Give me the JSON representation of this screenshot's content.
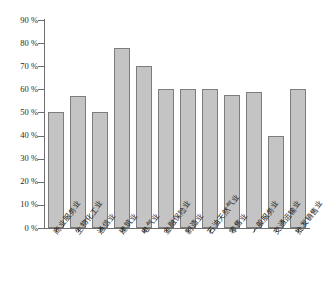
{
  "chart_data": {
    "type": "bar",
    "title": "",
    "xlabel": "",
    "ylabel": "",
    "ylim": [
      0,
      90
    ],
    "ytick_step": 10,
    "grid": false,
    "legend": null,
    "bar_color": "#c4c4c4",
    "bar_edge_color": "#7d7d7d",
    "axis_color": "#6e6e6e",
    "categories": [
      "商业服务业",
      "生物化工业",
      "通信业",
      "建筑业",
      "电气业",
      "金融保险业",
      "制造业",
      "石油天然气业",
      "零售业",
      "一般服务业",
      "交通运输业",
      "批发销售业"
    ],
    "values": [
      50,
      57,
      50,
      78,
      70,
      60,
      60,
      60,
      57.5,
      59,
      40,
      60
    ],
    "ytick_labels": [
      "0 %",
      "10 %",
      "20 %",
      "30 %",
      "40 %",
      "50 %",
      "60 %",
      "70 %",
      "80 %",
      "90 %"
    ],
    "ytick_values": [
      0,
      10,
      20,
      30,
      40,
      50,
      60,
      70,
      80,
      90
    ]
  },
  "caption": ""
}
